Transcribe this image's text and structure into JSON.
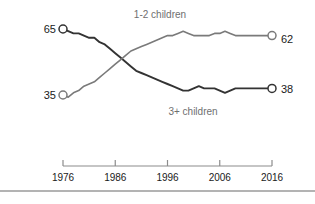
{
  "chart_data": {
    "type": "line",
    "title": "",
    "subtitle": "",
    "xlabel": "",
    "ylabel": "",
    "xlim": [
      1976,
      2016
    ],
    "ylim": [
      30,
      70
    ],
    "grid": false,
    "legend_position": "inline-annotations",
    "x": [
      1976,
      1977,
      1978,
      1979,
      1980,
      1981,
      1982,
      1983,
      1984,
      1985,
      1986,
      1987,
      1988,
      1989,
      1990,
      1991,
      1992,
      1993,
      1994,
      1995,
      1996,
      1997,
      1998,
      1999,
      2000,
      2001,
      2002,
      2003,
      2004,
      2005,
      2006,
      2007,
      2008,
      2009,
      2010,
      2011,
      2012,
      2013,
      2014,
      2015,
      2016
    ],
    "tick_labels": [
      "1976",
      "1986",
      "1996",
      "2006",
      "2016"
    ],
    "tick_values": [
      1976,
      1986,
      1996,
      2006,
      2016
    ],
    "series": [
      {
        "name": "3+ children",
        "color": "#333333",
        "start_value": 65,
        "end_value": 38,
        "start_label": "65",
        "end_label": "38",
        "values": [
          65,
          64,
          63,
          63,
          62,
          61,
          61,
          59,
          58,
          56,
          54,
          52,
          50,
          48,
          46,
          45,
          44,
          43,
          42,
          41,
          40,
          39,
          38,
          37,
          37,
          38,
          39,
          38,
          38,
          38,
          37,
          36,
          37,
          38,
          38,
          38,
          38,
          38,
          38,
          38,
          38
        ]
      },
      {
        "name": "1-2 children",
        "color": "#7a7a7a",
        "start_value": 35,
        "end_value": 62,
        "start_label": "35",
        "end_label": "62",
        "values": [
          35,
          34,
          36,
          37,
          39,
          40,
          41,
          43,
          45,
          47,
          49,
          51,
          53,
          55,
          56,
          57,
          58,
          59,
          60,
          61,
          62,
          62,
          63,
          64,
          63,
          62,
          62,
          62,
          62,
          63,
          63,
          64,
          63,
          62,
          62,
          62,
          62,
          62,
          62,
          62,
          62
        ]
      }
    ],
    "annotations": [
      {
        "text": "1-2 children",
        "for_series": "1-2 children"
      },
      {
        "text": "3+ children",
        "for_series": "3+ children"
      }
    ]
  },
  "axis": {
    "tick_labels": [
      "1976",
      "1986",
      "1996",
      "2006",
      "2016"
    ]
  },
  "labels": {
    "top_left_value": "65",
    "bottom_left_value": "35",
    "top_right_value": "62",
    "bottom_right_value": "38",
    "upper_series": "1-2 children",
    "lower_series": "3+ children"
  },
  "colors": {
    "dark_line": "#333333",
    "gray_line": "#7a7a7a",
    "axis": "#8c8c8c",
    "text": "#1a1a1a",
    "muted_text": "#6f6f6f",
    "divider": "#9a9a9a",
    "background": "#ffffff"
  }
}
